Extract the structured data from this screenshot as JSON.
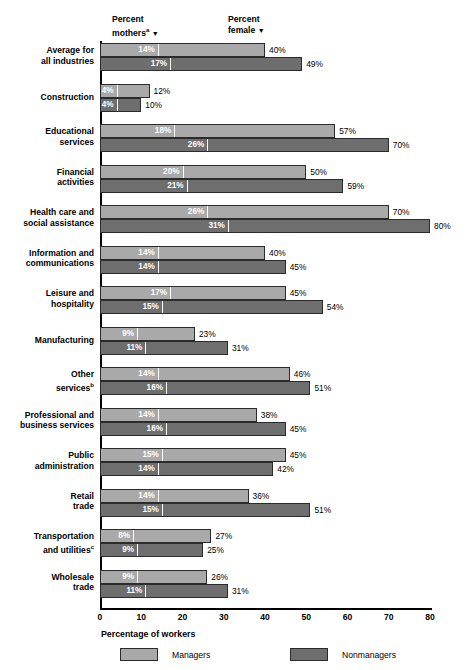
{
  "headers": {
    "mothers": "Percent",
    "mothers_line2": "mothers",
    "mothers_sup": "a",
    "mothers_caret": "▼",
    "female": "Percent",
    "female_line2": "female",
    "female_caret": "▼"
  },
  "axis": {
    "title": "Percentage of workers",
    "ticks": [
      "0",
      "10",
      "20",
      "30",
      "40",
      "50",
      "60",
      "70",
      "80"
    ]
  },
  "legend": {
    "managers": "Managers",
    "nonmanagers": "Nonmanagers"
  },
  "colors": {
    "managers": "#a9a9a9",
    "nonmanagers": "#6e6e6e",
    "axis": "#000000",
    "mother_marker": "#ffffff"
  },
  "categories": [
    {
      "label_line1": "Average for",
      "label_line2": "all industries",
      "sup": ""
    },
    {
      "label_line1": "Construction",
      "label_line2": "",
      "sup": ""
    },
    {
      "label_line1": "Educational",
      "label_line2": "services",
      "sup": ""
    },
    {
      "label_line1": "Financial",
      "label_line2": "activities",
      "sup": ""
    },
    {
      "label_line1": "Health care and",
      "label_line2": "social assistance",
      "sup": ""
    },
    {
      "label_line1": "Information and",
      "label_line2": "communications",
      "sup": ""
    },
    {
      "label_line1": "Leisure and",
      "label_line2": "hospitality",
      "sup": ""
    },
    {
      "label_line1": "Manufacturing",
      "label_line2": "",
      "sup": ""
    },
    {
      "label_line1": "Other",
      "label_line2": "services",
      "sup": "b"
    },
    {
      "label_line1": "Professional and",
      "label_line2": "business services",
      "sup": ""
    },
    {
      "label_line1": "Public",
      "label_line2": "administration",
      "sup": ""
    },
    {
      "label_line1": "Retail",
      "label_line2": "trade",
      "sup": ""
    },
    {
      "label_line1": "Transportation",
      "label_line2": "and utilities",
      "sup": "c"
    },
    {
      "label_line1": "Wholesale",
      "label_line2": "trade",
      "sup": ""
    }
  ],
  "chart_data": {
    "type": "bar",
    "title": "",
    "xlabel": "Percentage of workers",
    "ylabel": "",
    "xlim": [
      0,
      80
    ],
    "grid": false,
    "legend_position": "bottom",
    "orientation": "horizontal",
    "categories": [
      "Average for all industries",
      "Construction",
      "Educational services",
      "Financial activities",
      "Health care and social assistance",
      "Information and communications",
      "Leisure and hospitality",
      "Manufacturing",
      "Other services",
      "Professional and business services",
      "Public administration",
      "Retail trade",
      "Transportation and utilities",
      "Wholesale trade"
    ],
    "series": [
      {
        "name": "Managers",
        "metric": "Percent female",
        "values": [
          40,
          12,
          57,
          50,
          70,
          40,
          45,
          23,
          46,
          38,
          45,
          36,
          27,
          26
        ],
        "labels": [
          "40%",
          "12%",
          "57%",
          "50%",
          "70%",
          "40%",
          "45%",
          "23%",
          "46%",
          "38%",
          "45%",
          "36%",
          "27%",
          "26%"
        ]
      },
      {
        "name": "Nonmanagers",
        "metric": "Percent female",
        "values": [
          49,
          10,
          70,
          59,
          80,
          45,
          54,
          31,
          51,
          45,
          42,
          51,
          25,
          31
        ],
        "labels": [
          "49%",
          "10%",
          "70%",
          "59%",
          "80%",
          "45%",
          "54%",
          "31%",
          "51%",
          "45%",
          "42%",
          "51%",
          "25%",
          "31%"
        ]
      },
      {
        "name": "Managers",
        "metric": "Percent mothers",
        "values": [
          14,
          4,
          18,
          20,
          26,
          14,
          17,
          9,
          14,
          14,
          15,
          14,
          8,
          9
        ],
        "labels": [
          "14%",
          "4%",
          "18%",
          "20%",
          "26%",
          "14%",
          "17%",
          "9%",
          "14%",
          "14%",
          "15%",
          "14%",
          "8%",
          "9%"
        ]
      },
      {
        "name": "Nonmanagers",
        "metric": "Percent mothers",
        "values": [
          17,
          4,
          26,
          21,
          31,
          14,
          15,
          11,
          16,
          16,
          14,
          15,
          9,
          11
        ],
        "labels": [
          "17%",
          "4%",
          "26%",
          "21%",
          "31%",
          "14%",
          "15%",
          "11%",
          "16%",
          "16%",
          "14%",
          "15%",
          "9%",
          "11%"
        ]
      }
    ]
  }
}
